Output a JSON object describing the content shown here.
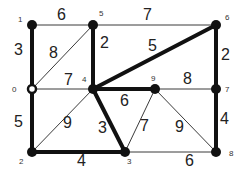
{
  "graph": {
    "nodes": [
      {
        "id": "0",
        "x": 32,
        "y": 89,
        "hollow": true,
        "lx": 12,
        "ly": 92
      },
      {
        "id": "1",
        "x": 32,
        "y": 25,
        "lx": 18,
        "ly": 22
      },
      {
        "id": "2",
        "x": 32,
        "y": 152,
        "lx": 19,
        "ly": 164
      },
      {
        "id": "3",
        "x": 125,
        "y": 152,
        "lx": 127,
        "ly": 164
      },
      {
        "id": "4",
        "x": 93,
        "y": 89,
        "lx": 82,
        "ly": 82
      },
      {
        "id": "5",
        "x": 93,
        "y": 25,
        "lx": 99,
        "ly": 16
      },
      {
        "id": "6",
        "x": 216,
        "y": 25,
        "lx": 225,
        "ly": 20
      },
      {
        "id": "7",
        "x": 216,
        "y": 89,
        "lx": 225,
        "ly": 92
      },
      {
        "id": "8",
        "x": 216,
        "y": 152,
        "lx": 229,
        "ly": 156
      },
      {
        "id": "9",
        "x": 155,
        "y": 89,
        "lx": 151,
        "ly": 81
      }
    ],
    "edges": [
      {
        "from": "1",
        "to": "5",
        "weight": "6",
        "thick": false,
        "wx": 57,
        "wy": 20
      },
      {
        "from": "5",
        "to": "6",
        "weight": "7",
        "thick": false,
        "wx": 143,
        "wy": 20
      },
      {
        "from": "1",
        "to": "0",
        "weight": "3",
        "thick": true,
        "wx": 14,
        "wy": 55
      },
      {
        "from": "0",
        "to": "5",
        "weight": "8",
        "thick": false,
        "wx": 49,
        "wy": 58
      },
      {
        "from": "5",
        "to": "4",
        "weight": "2",
        "thick": true,
        "wx": 100,
        "wy": 48
      },
      {
        "from": "4",
        "to": "6",
        "weight": "5",
        "thick": true,
        "wx": 148,
        "wy": 51
      },
      {
        "from": "6",
        "to": "7",
        "weight": "2",
        "thick": true,
        "wx": 221,
        "wy": 60
      },
      {
        "from": "0",
        "to": "4",
        "weight": "7",
        "thick": false,
        "wx": 64,
        "wy": 85
      },
      {
        "from": "4",
        "to": "9",
        "weight": "6",
        "thick": true,
        "wx": 120,
        "wy": 106
      },
      {
        "from": "9",
        "to": "7",
        "weight": "8",
        "thick": false,
        "wx": 183,
        "wy": 84
      },
      {
        "from": "0",
        "to": "2",
        "weight": "5",
        "thick": true,
        "wx": 14,
        "wy": 127
      },
      {
        "from": "2",
        "to": "4",
        "weight": "9",
        "thick": false,
        "wx": 63,
        "wy": 128
      },
      {
        "from": "4",
        "to": "3",
        "weight": "3",
        "thick": true,
        "wx": 98,
        "wy": 133
      },
      {
        "from": "9",
        "to": "3",
        "weight": "7",
        "thick": false,
        "wx": 140,
        "wy": 131
      },
      {
        "from": "9",
        "to": "8",
        "weight": "9",
        "thick": false,
        "wx": 175,
        "wy": 132
      },
      {
        "from": "7",
        "to": "8",
        "weight": "4",
        "thick": true,
        "wx": 220,
        "wy": 124
      },
      {
        "from": "2",
        "to": "3",
        "weight": "4",
        "thick": true,
        "wx": 77,
        "wy": 166
      },
      {
        "from": "3",
        "to": "8",
        "weight": "6",
        "thick": false,
        "wx": 185,
        "wy": 166
      }
    ]
  }
}
